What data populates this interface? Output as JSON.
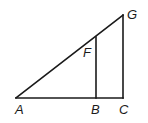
{
  "diagram": {
    "type": "geometry",
    "points": {
      "A": {
        "label": "A",
        "x": 16,
        "y": 98
      },
      "B": {
        "label": "B",
        "x": 96,
        "y": 98
      },
      "C": {
        "label": "C",
        "x": 123,
        "y": 98
      },
      "F": {
        "label": "F",
        "x": 96,
        "y": 37
      },
      "G": {
        "label": "G",
        "x": 123,
        "y": 15
      }
    },
    "segments": [
      [
        "A",
        "C"
      ],
      [
        "C",
        "G"
      ],
      [
        "A",
        "G"
      ],
      [
        "B",
        "F"
      ]
    ],
    "labels": {
      "A": "A",
      "B": "B",
      "C": "C",
      "F": "F",
      "G": "G"
    }
  }
}
